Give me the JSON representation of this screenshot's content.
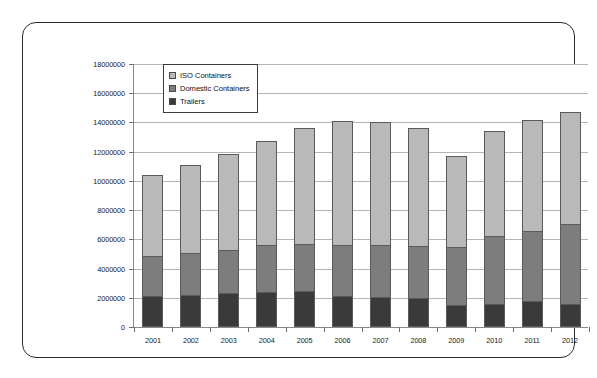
{
  "chart_data": {
    "type": "bar",
    "subtype": "stacked-bar",
    "title": "",
    "xlabel": "",
    "ylabel": "",
    "categories": [
      "2001",
      "2002",
      "2003",
      "2004",
      "2005",
      "2006",
      "2007",
      "2008",
      "2009",
      "2010",
      "2011",
      "2012"
    ],
    "series": [
      {
        "name": "Trailers",
        "color": "#3a3a3a",
        "values": [
          2100000,
          2200000,
          2300000,
          2400000,
          2450000,
          2100000,
          2050000,
          2000000,
          1500000,
          1600000,
          1750000,
          1550000
        ]
      },
      {
        "name": "Domestic Containers",
        "color": "#7d7d7d",
        "values": [
          2750000,
          2900000,
          3000000,
          3200000,
          3200000,
          3500000,
          3550000,
          3550000,
          4000000,
          4600000,
          4850000,
          5500000
        ]
      },
      {
        "name": "ISO Containers",
        "color": "#b9b9b9",
        "values": [
          5550000,
          6000000,
          6550000,
          7100000,
          7950000,
          8500000,
          8400000,
          8100000,
          6200000,
          7200000,
          7550000,
          7650000
        ]
      }
    ],
    "totals": [
      10400000,
      11100000,
      11850000,
      12700000,
      13600000,
      14100000,
      14000000,
      13650000,
      11700000,
      13400000,
      14150000,
      14700000
    ],
    "stack_order_bottom_to_top": [
      "Trailers",
      "Domestic Containers",
      "ISO Containers"
    ],
    "ylim": [
      0,
      18000000
    ],
    "ytick_step": 2000000,
    "yticks": [
      "0",
      "2000000",
      "4000000",
      "6000000",
      "8000000",
      "10000000",
      "12000000",
      "14000000",
      "16000000",
      "18000000"
    ],
    "grid": true,
    "legend_position": "top-left-inside",
    "legend": [
      {
        "label": "ISO Containers",
        "color": "#b9b9b9"
      },
      {
        "label": "Domestic Containers",
        "color": "#7d7d7d"
      },
      {
        "label": "Trailers",
        "color": "#3a3a3a"
      }
    ]
  }
}
